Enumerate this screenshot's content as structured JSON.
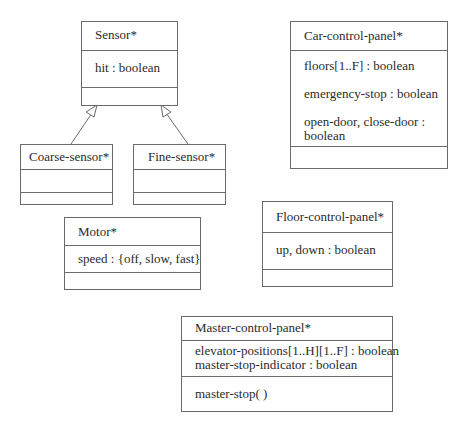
{
  "diagram": {
    "type": "UML class diagram",
    "classes": {
      "sensor": {
        "name": "Sensor*",
        "attributes": [
          "hit : boolean"
        ],
        "operations": []
      },
      "coarse_sensor": {
        "name": "Coarse-sensor*",
        "attributes": [],
        "operations": []
      },
      "fine_sensor": {
        "name": "Fine-sensor*",
        "attributes": [],
        "operations": []
      },
      "car_control_panel": {
        "name": "Car-control-panel*",
        "attributes": [
          "floors[1..F] : boolean",
          "emergency-stop : boolean",
          "open-door, close-door : boolean"
        ],
        "operations": []
      },
      "motor": {
        "name": "Motor*",
        "attributes": [
          "speed : {off, slow, fast}"
        ],
        "operations": []
      },
      "floor_control_panel": {
        "name": "Floor-control-panel*",
        "attributes": [
          "up, down : boolean"
        ],
        "operations": []
      },
      "master_control_panel": {
        "name": "Master-control-panel*",
        "attributes": [
          "elevator-positions[1..H][1..F] : boolean",
          "master-stop-indicator : boolean"
        ],
        "operations": [
          "master-stop( )"
        ]
      }
    },
    "relations": [
      {
        "type": "generalization",
        "from": "Coarse-sensor*",
        "to": "Sensor*"
      },
      {
        "type": "generalization",
        "from": "Fine-sensor*",
        "to": "Sensor*"
      }
    ],
    "colors": {
      "line": "#6a6a6a",
      "text": "#2a2a2a",
      "background": "#ffffff"
    }
  }
}
